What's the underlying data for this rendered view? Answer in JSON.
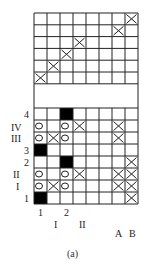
{
  "figure": {
    "caption": "(a)",
    "grid": {
      "cols": 8,
      "left": 34,
      "col_width": 13,
      "top_section": {
        "top": 13,
        "row_height": 11.8,
        "rows": 6,
        "x_marks": [
          [
            0,
            7
          ],
          [
            1,
            6
          ],
          [
            2,
            3
          ],
          [
            3,
            2
          ],
          [
            4,
            1
          ],
          [
            5,
            0
          ]
        ]
      },
      "empty_band": {
        "top": 84,
        "bottom": 108
      },
      "bottom_section": {
        "top": 108,
        "row_height": 12,
        "rows": [
          {
            "label": "4",
            "black": [
              2
            ],
            "circles": [],
            "x_marks": []
          },
          {
            "label": "IV",
            "black": [],
            "circles": [
              0,
              2
            ],
            "x_marks": [
              3,
              6
            ]
          },
          {
            "label": "III",
            "black": [],
            "circles": [
              0,
              2
            ],
            "x_marks": [
              1,
              6
            ]
          },
          {
            "label": "3",
            "black": [
              0
            ],
            "circles": [],
            "x_marks": []
          },
          {
            "label": "2",
            "black": [
              2
            ],
            "circles": [],
            "x_marks": [
              7
            ]
          },
          {
            "label": "II",
            "black": [],
            "circles": [
              0,
              2
            ],
            "x_marks": [
              3,
              6,
              7
            ]
          },
          {
            "label": "I",
            "black": [],
            "circles": [
              0,
              2
            ],
            "x_marks": [
              1,
              6,
              7
            ]
          },
          {
            "label": "1",
            "black": [
              0
            ],
            "circles": [],
            "x_marks": [
              7
            ]
          }
        ]
      }
    },
    "row_labels": [
      {
        "text": "4",
        "x": 24,
        "y": 110
      },
      {
        "text": "IV",
        "x": 11,
        "y": 123
      },
      {
        "text": "III",
        "x": 11,
        "y": 134
      },
      {
        "text": "3",
        "x": 24,
        "y": 146
      },
      {
        "text": "2",
        "x": 24,
        "y": 158
      },
      {
        "text": "II",
        "x": 13,
        "y": 170
      },
      {
        "text": "I",
        "x": 16,
        "y": 182
      },
      {
        "text": "1",
        "x": 24,
        "y": 194
      }
    ],
    "bottom_labels": {
      "col1": "1",
      "col2": "2",
      "roman1": "I",
      "roman2": "II",
      "a": "A",
      "b": "B"
    }
  }
}
